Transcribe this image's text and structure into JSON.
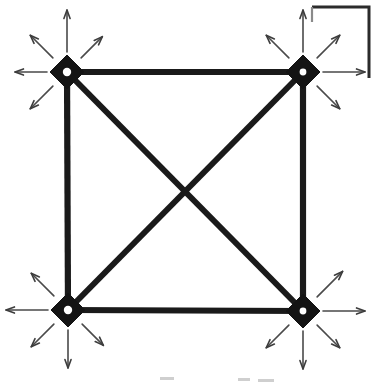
{
  "figure": {
    "background_color": "#ffffff",
    "ink_color": "#1a1a1a",
    "arrow_color": "#4a4a4a",
    "width": 378,
    "height": 383
  },
  "nodes": [
    {
      "id": "top-left",
      "label": "top-left-node",
      "x": 67,
      "y": 72,
      "half_width": 17,
      "half_height": 17,
      "hole_radius": 4.2
    },
    {
      "id": "top-right",
      "label": "top-right-node",
      "x": 303,
      "y": 72,
      "half_width": 17,
      "half_height": 17,
      "hole_radius": 3.4
    },
    {
      "id": "bottom-left",
      "label": "bottom-left-node",
      "x": 68,
      "y": 310,
      "half_width": 17,
      "half_height": 17,
      "hole_radius": 4.2
    },
    {
      "id": "bottom-right",
      "label": "bottom-right-node",
      "x": 303,
      "y": 311,
      "half_width": 17,
      "half_height": 17,
      "hole_radius": 3.4
    }
  ],
  "edges": [
    {
      "id": "edge-top",
      "from": "top-left",
      "to": "top-right",
      "kind": "side"
    },
    {
      "id": "edge-left",
      "from": "top-left",
      "to": "bottom-left",
      "kind": "side"
    },
    {
      "id": "edge-right",
      "from": "top-right",
      "to": "bottom-right",
      "kind": "side"
    },
    {
      "id": "edge-bottom",
      "from": "bottom-left",
      "to": "bottom-right",
      "kind": "side"
    },
    {
      "id": "edge-diagonal-nwse",
      "from": "top-left",
      "to": "bottom-right",
      "kind": "diagonal"
    },
    {
      "id": "edge-diagonal-nesw",
      "from": "top-right",
      "to": "bottom-left",
      "kind": "diagonal"
    }
  ],
  "arrows": {
    "count_per_node": 5,
    "length_short": 44,
    "length_long": 60,
    "head_length": 9,
    "head_angle_deg": 20,
    "groups": [
      {
        "node": "top-left",
        "directions": [
          {
            "name": "up",
            "angle_deg": 270,
            "length": 62
          },
          {
            "name": "up-left",
            "angle_deg": 225,
            "length": 52
          },
          {
            "name": "up-right",
            "angle_deg": 315,
            "length": 50
          },
          {
            "name": "left",
            "angle_deg": 180,
            "length": 52
          },
          {
            "name": "down-left",
            "angle_deg": 135,
            "length": 52
          }
        ]
      },
      {
        "node": "top-right",
        "directions": [
          {
            "name": "up",
            "angle_deg": 270,
            "length": 62
          },
          {
            "name": "up-left",
            "angle_deg": 225,
            "length": 52
          },
          {
            "name": "up-right",
            "angle_deg": 315,
            "length": 52
          },
          {
            "name": "right",
            "angle_deg": 0,
            "length": 62
          },
          {
            "name": "down-right",
            "angle_deg": 45,
            "length": 52
          }
        ]
      },
      {
        "node": "bottom-left",
        "directions": [
          {
            "name": "up-left",
            "angle_deg": 225,
            "length": 52
          },
          {
            "name": "left",
            "angle_deg": 180,
            "length": 62
          },
          {
            "name": "down-left",
            "angle_deg": 135,
            "length": 52
          },
          {
            "name": "down",
            "angle_deg": 90,
            "length": 58
          },
          {
            "name": "down-right",
            "angle_deg": 45,
            "length": 50
          }
        ]
      },
      {
        "node": "bottom-right",
        "directions": [
          {
            "name": "up-right",
            "angle_deg": 315,
            "length": 56
          },
          {
            "name": "right",
            "angle_deg": 0,
            "length": 62
          },
          {
            "name": "down-right",
            "angle_deg": 45,
            "length": 52
          },
          {
            "name": "down",
            "angle_deg": 90,
            "length": 58
          },
          {
            "name": "down-left",
            "angle_deg": 135,
            "length": 52
          }
        ]
      }
    ]
  },
  "bracket": {
    "id": "corner-bracket",
    "label": "open-corner-bracket",
    "top_y": 7,
    "left_x": 312,
    "right_x": 369,
    "bottom_y": 78,
    "stub_bottom_y": 22,
    "description": "Open rectangular bracket in the upper-right area drawn with a full top edge, full right edge, and a short left stub."
  },
  "artifacts": {
    "label": "scan-smudges",
    "marks": [
      {
        "x": 160,
        "y": 377,
        "w": 14,
        "h": 3
      },
      {
        "x": 238,
        "y": 378,
        "w": 12,
        "h": 3
      },
      {
        "x": 258,
        "y": 379,
        "w": 16,
        "h": 3
      }
    ]
  }
}
